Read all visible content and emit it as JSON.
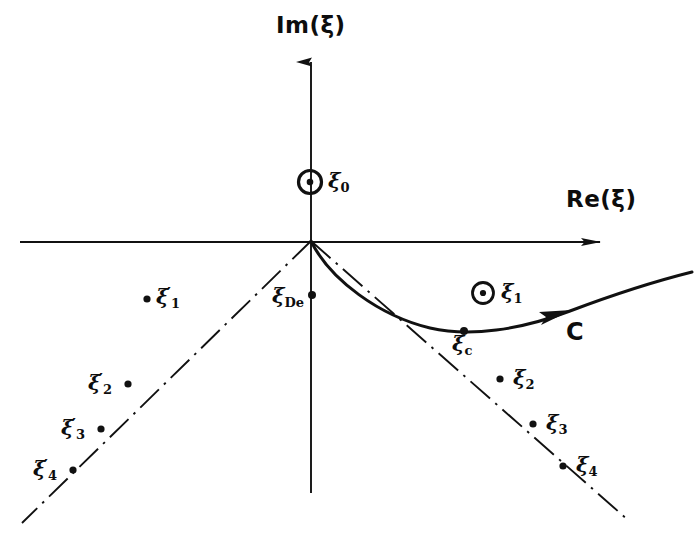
{
  "figure": {
    "kind": "complex-plane-contour-diagram",
    "background_color": "#ffffff",
    "ink_color": "#111111",
    "axes": {
      "real": {
        "label": "Re(ξ)",
        "arrow": "right",
        "x_start": 20,
        "x_end": 617,
        "y": 242
      },
      "imag": {
        "label": "Im(ξ)",
        "arrow": "up",
        "x": 311,
        "y_start": 493,
        "y_end": 48
      }
    },
    "contour": {
      "name": "C",
      "label": "C",
      "direction_arrow": "rightward",
      "description": "steepest-descent contour from origin dipping below the real axis through ξ_c then rising to the right"
    },
    "poles": [
      {
        "id": "xi0",
        "label": "ξ",
        "sub": "0",
        "prime": false,
        "marker": "circled-dot",
        "x": 310,
        "y": 182
      },
      {
        "id": "xi1",
        "label": "ξ",
        "sub": "1",
        "prime": false,
        "marker": "circled-dot",
        "x": 483,
        "y": 293
      }
    ],
    "points": [
      {
        "id": "xiDe",
        "label": "ξ",
        "sub": "De",
        "prime": false,
        "marker": "dot",
        "x": 312,
        "y": 295,
        "label_side": "left"
      },
      {
        "id": "xic",
        "label": "ξ",
        "sub": "c",
        "prime": false,
        "marker": "dot",
        "x": 464,
        "y": 331,
        "label_side": "below"
      },
      {
        "id": "xi1p",
        "label": "ξ",
        "sub": "1",
        "prime": true,
        "marker": "dot",
        "x": 147,
        "y": 299,
        "label_side": "right"
      },
      {
        "id": "xi2p",
        "label": "ξ",
        "sub": "2",
        "prime": true,
        "marker": "dot",
        "x": 128,
        "y": 384,
        "label_side": "left"
      },
      {
        "id": "xi3p",
        "label": "ξ",
        "sub": "3",
        "prime": true,
        "marker": "dot",
        "x": 101,
        "y": 429,
        "label_side": "left"
      },
      {
        "id": "xi4p",
        "label": "ξ",
        "sub": "4",
        "prime": true,
        "marker": "dot",
        "x": 73,
        "y": 470,
        "label_side": "left"
      },
      {
        "id": "xi2",
        "label": "ξ",
        "sub": "2",
        "prime": false,
        "marker": "dot",
        "x": 500,
        "y": 379,
        "label_side": "right"
      },
      {
        "id": "xi3",
        "label": "ξ",
        "sub": "3",
        "prime": false,
        "marker": "dot",
        "x": 533,
        "y": 424,
        "label_side": "right"
      },
      {
        "id": "xi4",
        "label": "ξ",
        "sub": "4",
        "prime": false,
        "marker": "dot",
        "x": 563,
        "y": 466,
        "label_side": "right"
      }
    ],
    "asymptotes": [
      {
        "id": "left-branch",
        "style": "dash-dot",
        "from": [
          311,
          241
        ],
        "to": [
          22,
          523
        ]
      },
      {
        "id": "right-branch",
        "style": "dash-dot",
        "from": [
          311,
          241
        ],
        "to": [
          628,
          520
        ]
      }
    ],
    "labels": {
      "re_axis": "Re(ξ)",
      "im_axis": "Im(ξ)",
      "contour": "C",
      "xi0": "ξ",
      "xi0_sub": "0",
      "xi1": "ξ",
      "xi1_sub": "1",
      "xiDe": "ξ",
      "xiDe_sub": "De",
      "xic": "ξ",
      "xic_sub": "c",
      "xi1p_sub": "1",
      "xi2p_sub": "2",
      "xi3p_sub": "3",
      "xi4p_sub": "4",
      "xi2_sub": "2",
      "xi3_sub": "3",
      "xi4_sub": "4",
      "prime": "′",
      "xi": "ξ"
    }
  }
}
